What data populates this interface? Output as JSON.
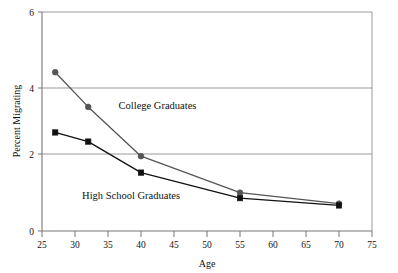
{
  "chart_data": {
    "type": "line",
    "title": "",
    "xlabel": "Age",
    "ylabel": "Percent Migrating",
    "xlim": [
      25,
      75
    ],
    "ylim": [
      0,
      6
    ],
    "xticks": [
      25,
      30,
      35,
      40,
      45,
      50,
      55,
      60,
      65,
      70,
      75
    ],
    "yticks": [
      0,
      2,
      4,
      6
    ],
    "grid": "horizontal",
    "gridlines_at": [
      2,
      4,
      6
    ],
    "legend_position": "inline-annotations",
    "series": [
      {
        "name": "College Graduates",
        "marker": "circle",
        "color": "#555555",
        "x": [
          27,
          32,
          40,
          55,
          70
        ],
        "values": [
          4.35,
          3.4,
          2.05,
          1.05,
          0.75
        ]
      },
      {
        "name": "High School Graduates",
        "marker": "square",
        "color": "#111111",
        "x": [
          27,
          32,
          40,
          55,
          70
        ],
        "values": [
          2.7,
          2.45,
          1.6,
          0.9,
          0.7
        ]
      }
    ],
    "annotations": [
      {
        "text": "College Graduates",
        "x": 42.5,
        "y": 3.35
      },
      {
        "text": "High School Graduates",
        "x": 38.5,
        "y": 0.88
      }
    ]
  },
  "axes": {
    "y_tick_labels": [
      "6",
      "4",
      "2",
      "0"
    ],
    "x_tick_labels": [
      "25",
      "30",
      "35",
      "40",
      "45",
      "50",
      "55",
      "60",
      "65",
      "70",
      "75"
    ],
    "x_axis_title": "Age",
    "y_axis_title": "Percent Migrating"
  },
  "colors": {
    "college_line": "#555555",
    "highschool_line": "#111111",
    "gridline": "#9a9a9a",
    "axis": "#777777",
    "background": "#ffffff"
  }
}
